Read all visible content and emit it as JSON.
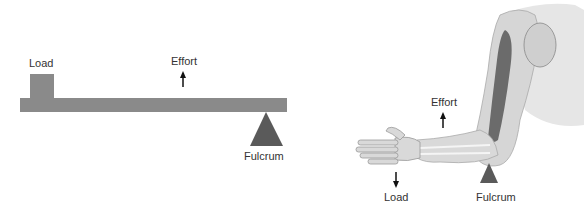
{
  "lever_diagram": {
    "load_label": "Load",
    "effort_label": "Effort",
    "fulcrum_label": "Fulcrum",
    "colors": {
      "beam": "#8a8a8a",
      "load_block": "#8a8a8a",
      "fulcrum": "#5a5a5a",
      "arrow": "#111111"
    }
  },
  "arm_diagram": {
    "effort_label": "Effort",
    "load_label": "Load",
    "fulcrum_label": "Fulcrum",
    "colors": {
      "skin": "#d9d9d9",
      "muscle": "#6b6b6b",
      "bone": "#f2f2f2",
      "fulcrum": "#5a5a5a",
      "arrow": "#111111"
    }
  }
}
